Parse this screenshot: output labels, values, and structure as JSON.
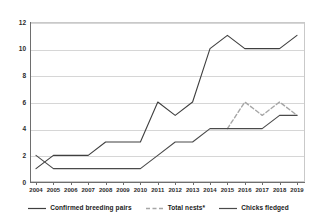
{
  "chart_data": {
    "type": "line",
    "title": "",
    "subtitle": "",
    "xlabel": "",
    "ylabel": "",
    "grid": "horizontal",
    "legend_position": "bottom",
    "xlim": [
      2004,
      2019
    ],
    "ylim": [
      0,
      12
    ],
    "yticks": [
      0,
      2,
      4,
      6,
      8,
      10,
      12
    ],
    "categories": [
      2004,
      2005,
      2006,
      2007,
      2008,
      2009,
      2010,
      2011,
      2012,
      2013,
      2014,
      2015,
      2016,
      2017,
      2018,
      2019
    ],
    "xtick_labels": [
      "2004",
      "2005",
      "2006",
      "2007",
      "2008",
      "2009",
      "2010",
      "2011",
      "2012",
      "2013",
      "2014",
      "2015",
      "2016",
      "2017",
      "2018",
      "2019"
    ],
    "ytick_labels": [
      "0",
      "2",
      "4",
      "6",
      "8",
      "10",
      "12"
    ],
    "series": [
      {
        "name": "Confirmed breeding pairs",
        "style": "solid",
        "color": "#3f3f3f",
        "values": [
          1,
          2,
          2,
          2,
          3,
          3,
          3,
          6,
          5,
          6,
          10,
          11,
          10,
          10,
          10,
          11
        ]
      },
      {
        "name": "Total nests*",
        "style": "dashed",
        "color": "#a6a6a6",
        "values": [
          null,
          null,
          null,
          null,
          null,
          null,
          null,
          null,
          null,
          null,
          null,
          4,
          6,
          5,
          6,
          5
        ]
      },
      {
        "name": "Chicks fledged",
        "style": "solid",
        "color": "#4a4a4a",
        "values": [
          2,
          1,
          1,
          1,
          1,
          1,
          1,
          2,
          3,
          3,
          4,
          4,
          4,
          4,
          5,
          5
        ]
      }
    ]
  },
  "legend": {
    "items": [
      {
        "label": "Confirmed breeding pairs",
        "swatch": "solid-line-swatch"
      },
      {
        "label": "Total nests*",
        "swatch": "dashed-line-swatch"
      },
      {
        "label": "Chicks fledged",
        "swatch": "solid-line-swatch"
      }
    ]
  },
  "colors": {
    "series_primary": "#3f3f3f",
    "series_dashed": "#a6a6a6",
    "series_tertiary": "#4a4a4a",
    "gridline": "#d6d6d6",
    "axis": "#6e6e6e",
    "plot_border": "#c9c9c9",
    "background": "#ffffff",
    "text": "#1a1a1a"
  }
}
